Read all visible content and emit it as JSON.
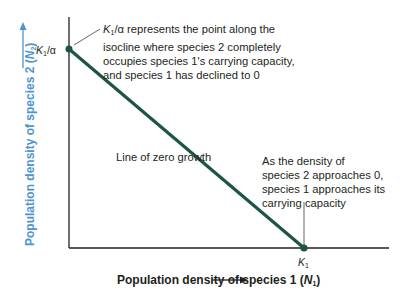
{
  "diagram": {
    "type": "competition-isocline",
    "y_axis": {
      "label": "Population density of species 2",
      "var": "N",
      "sub": "2",
      "color": "#4f93cf"
    },
    "x_axis": {
      "label": "Population density of species 1",
      "var": "N",
      "sub": "1",
      "color": "#231f20"
    },
    "intercept_y": {
      "label_k": "K",
      "label_sub": "1",
      "label_rest": "/α"
    },
    "intercept_x": {
      "label_k": "K",
      "label_sub": "1"
    },
    "line_label": "Line of zero growth",
    "line_color": "#1d5446",
    "annotation_top": {
      "k": "K",
      "sub": "1",
      "lines": [
        "/α represents the point along the",
        "isocline where species 2 completely",
        "occupies species 1's carrying capacity,",
        "and species 1 has declined to 0"
      ]
    },
    "annotation_right": {
      "lines": [
        "As the density of",
        "species 2 approaches 0,",
        "species 1 approaches its",
        "carrying capacity"
      ]
    }
  }
}
